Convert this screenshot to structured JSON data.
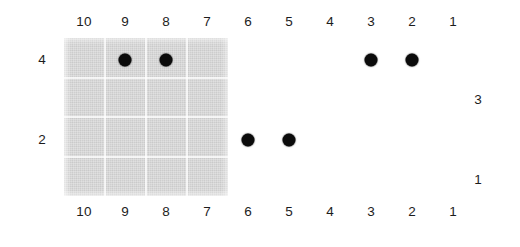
{
  "figure": {
    "title": "",
    "background_color": "#ffffff",
    "plate_color": "#d7d7d7",
    "dot_color": "#0b0b0b",
    "gridline_color": "#ffffff"
  },
  "axis": {
    "top_labels": [
      "10",
      "9",
      "8",
      "7",
      "6",
      "5",
      "4",
      "3",
      "2",
      "1"
    ],
    "bottom_labels": [
      "10",
      "9",
      "8",
      "7",
      "6",
      "5",
      "4",
      "3",
      "2",
      "1"
    ],
    "left_labels": [
      "4",
      "2"
    ],
    "right_labels": [
      "3",
      "1"
    ]
  },
  "chart_data": {
    "type": "scatter",
    "title": "",
    "xlabel": "",
    "ylabel": "",
    "x": [
      9,
      8,
      3,
      2,
      6,
      5
    ],
    "y": [
      4,
      4,
      4,
      4,
      2,
      2
    ],
    "categories": [
      "10",
      "9",
      "8",
      "7",
      "6",
      "5",
      "4",
      "3",
      "2",
      "1"
    ],
    "row_labels": [
      "4",
      "3",
      "2",
      "1"
    ],
    "series": [
      {
        "name": "marked-cells",
        "points": [
          {
            "column": 9,
            "row": 4
          },
          {
            "column": 8,
            "row": 4
          },
          {
            "column": 3,
            "row": 4
          },
          {
            "column": 2,
            "row": 4
          },
          {
            "column": 6,
            "row": 2
          },
          {
            "column": 5,
            "row": 2
          }
        ]
      }
    ],
    "xlim": [
      10,
      1
    ],
    "ylim": [
      4,
      1
    ],
    "grid": true,
    "legend": "none",
    "shaded_region": {
      "columns": [
        "10",
        "9",
        "8",
        "7"
      ],
      "rows": [
        "4",
        "3",
        "2",
        "1"
      ],
      "color": "#d7d7d7"
    }
  }
}
